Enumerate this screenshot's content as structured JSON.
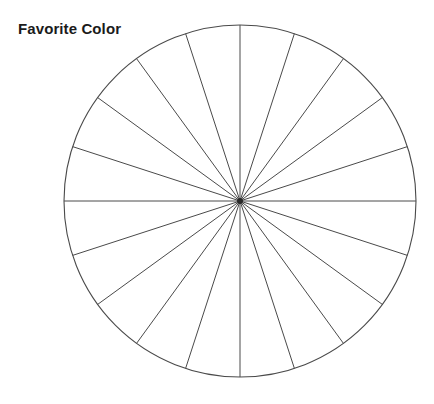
{
  "page": {
    "background_color": "#ffffff",
    "width": 434,
    "height": 404
  },
  "title": {
    "text": "Favorite Color",
    "color": "#1b1b1b"
  },
  "chart_data": {
    "type": "pie",
    "title": "Favorite Color",
    "subtitle": "",
    "xlabel": "",
    "ylabel": "",
    "blank_template": true,
    "categories": [],
    "values": [],
    "labels_shown": false,
    "legend": {
      "shown": false,
      "position": "none",
      "entries": []
    },
    "grid": false,
    "annotations": [],
    "sector_count": 20,
    "sector_angle_degrees": 18,
    "slice_percent_each": 5,
    "start_angle_degrees": 0,
    "geometry": {
      "center_x": 240,
      "center_y": 201,
      "radius": 176
    },
    "style": {
      "outline_color": "#4a4a4a",
      "outline_width": 1.1,
      "spoke_color": "#4a4a4a",
      "spoke_width": 1,
      "fill_color": "#ffffff",
      "center_dot_color": "#2a2a2a",
      "center_dot_radius": 3
    }
  }
}
